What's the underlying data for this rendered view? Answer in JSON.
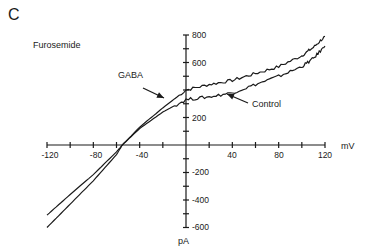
{
  "panel_label": "C",
  "condition_label": "Furosemide",
  "chart_data": {
    "type": "line",
    "title": "Furosemide",
    "panel": "C",
    "xlabel": "mV",
    "ylabel": "pA",
    "xlim": [
      -120,
      120
    ],
    "ylim": [
      -600,
      800
    ],
    "x_ticks": [
      -120,
      -80,
      -40,
      40,
      80,
      120
    ],
    "x_minor_step": 20,
    "y_ticks": [
      800,
      600,
      200,
      -200,
      -400,
      -600
    ],
    "y_minor_step": 100,
    "grid": false,
    "legend": "annotations with arrows",
    "series": [
      {
        "name": "GABA",
        "x": [
          -120,
          -100,
          -80,
          -60,
          -55,
          -40,
          -20,
          0,
          20,
          40,
          60,
          80,
          100,
          110,
          120
        ],
        "values": [
          -510,
          -360,
          -215,
          -50,
          0,
          130,
          270,
          400,
          440,
          470,
          520,
          570,
          650,
          710,
          790
        ]
      },
      {
        "name": "Control",
        "x": [
          -120,
          -100,
          -80,
          -60,
          -55,
          -40,
          -20,
          0,
          20,
          40,
          60,
          80,
          100,
          110,
          120
        ],
        "values": [
          -600,
          -430,
          -260,
          -70,
          0,
          120,
          240,
          330,
          350,
          380,
          440,
          500,
          570,
          630,
          720
        ]
      }
    ],
    "annotations": [
      {
        "text": "GABA",
        "points_to": "GABA"
      },
      {
        "text": "Control",
        "points_to": "Control"
      }
    ]
  },
  "labels": {
    "x_unit": "mV",
    "y_unit": "pA",
    "x_tick_labels": [
      "-120",
      "-80",
      "-40",
      "40",
      "80",
      "120"
    ],
    "y_tick_labels": [
      "800",
      "600",
      "200",
      "-200",
      "-400",
      "-600"
    ],
    "gaba": "GABA",
    "control": "Control"
  }
}
